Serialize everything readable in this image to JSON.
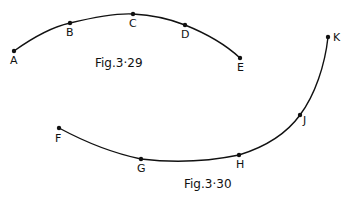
{
  "figures": [
    {
      "caption": "Fig.3·29",
      "points": [
        {
          "label": "A",
          "x": 14,
          "y": 51
        },
        {
          "label": "B",
          "x": 70,
          "y": 23
        },
        {
          "label": "C",
          "x": 133,
          "y": 14
        },
        {
          "label": "D",
          "x": 185,
          "y": 25
        },
        {
          "label": "E",
          "x": 240,
          "y": 58
        }
      ]
    },
    {
      "caption": "Fig.3·30",
      "points": [
        {
          "label": "F",
          "x": 59,
          "y": 128
        },
        {
          "label": "G",
          "x": 141,
          "y": 159
        },
        {
          "label": "H",
          "x": 239,
          "y": 155
        },
        {
          "label": "J",
          "x": 300,
          "y": 115
        },
        {
          "label": "K",
          "x": 328,
          "y": 37
        }
      ]
    }
  ],
  "colors": {
    "ink": "#111111",
    "background": "#ffffff"
  }
}
